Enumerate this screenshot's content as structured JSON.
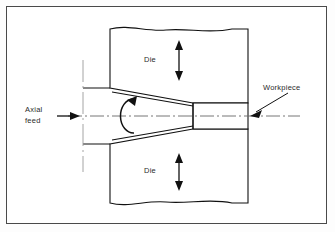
{
  "figure": {
    "kind": "engineering-process-diagram",
    "background_color": "#ffffff",
    "frame_color": "#4a4a4a",
    "line_color": "#111111",
    "centerline_color": "#666666"
  },
  "labels": {
    "axial_feed_line1": "Axial",
    "axial_feed_line2": "feed",
    "die_upper": "Die",
    "die_lower": "Die",
    "workpiece": "Workpiece"
  },
  "icons": {
    "axial_feed_arrow": "arrow-right-icon",
    "die_upper_motion_arrow": "double-arrow-vertical-icon",
    "die_lower_motion_arrow": "double-arrow-vertical-icon",
    "rotation_arrow": "curved-rotation-arrow-icon",
    "workpiece_leader": "leader-arrow-icon",
    "centerline": "centerline-dash-dot-icon",
    "break_line_top": "wavy-break-line-icon",
    "break_line_bottom": "wavy-break-line-icon"
  },
  "geometry": {
    "centerline_y": 116,
    "die_left_x": 110,
    "die_right_x": 248,
    "upper_die_top_y": 27,
    "upper_die_taper_start_y": 88,
    "upper_die_throat_y": 103,
    "lower_die_bottom_y": 205,
    "lower_die_taper_start_y": 144,
    "lower_die_throat_y": 129,
    "stock_top_y": 88,
    "stock_bottom_y": 144,
    "workpiece_top_y": 103,
    "workpiece_bottom_y": 129,
    "stock_left_x": 83,
    "workpiece_right_x": 248,
    "construction_line_x": 83
  }
}
